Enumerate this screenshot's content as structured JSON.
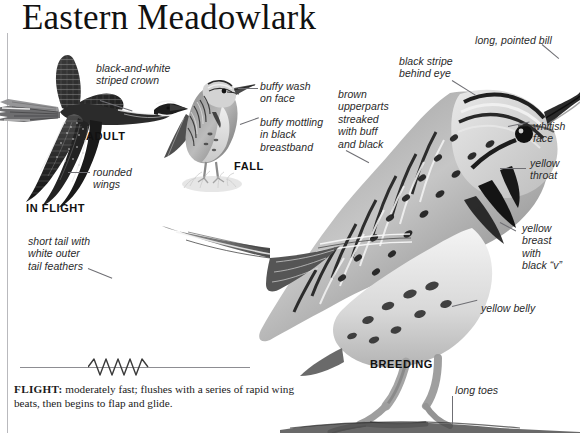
{
  "page": {
    "title": "Eastern Meadowlark",
    "background_color": "#ffffff",
    "rule_color": "#b9b9bd",
    "leader_color": "#6f6f74"
  },
  "plates": [
    {
      "id": "in-flight",
      "stage_label": "IN FLIGHT",
      "secondary_label": "ADULT"
    },
    {
      "id": "fall",
      "stage_label": "FALL"
    },
    {
      "id": "breeding",
      "stage_label": "BREEDING"
    }
  ],
  "labels": {
    "striped_crown": "black-and-white\nstriped crown",
    "rounded_wings": "rounded\nwings",
    "short_tail": "short tail with\nwhite outer\ntail feathers",
    "buffy_wash": "buffy wash\non face",
    "buffy_mottling": "buffy mottling\nin black\nbreastband",
    "brown_upperparts": "brown\nupperparts\nstreaked\nwith buff\nand black",
    "black_stripe": "black stripe\nbehind eye",
    "long_bill": "long, pointed bill",
    "whitish_face": "whitish\nface",
    "yellow_throat": "yellow\nthroat",
    "yellow_breast": "yellow\nbreast\nwith\nblack “v”",
    "yellow_belly": "yellow belly",
    "long_toes": "long toes"
  },
  "stage_labels": {
    "adult": "ADULT",
    "in_flight": "IN FLIGHT",
    "fall": "FALL",
    "breeding": "BREEDING"
  },
  "flight": {
    "heading": "FLIGHT:",
    "text": " moderately fast; flushes with a series of rapid wing beats, then begins to flap and glide."
  }
}
